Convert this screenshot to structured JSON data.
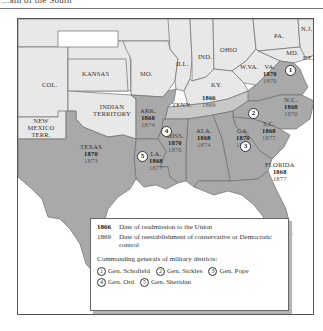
{
  "header": {
    "title": "...ath of the South"
  },
  "colors": {
    "union_states": "#e8e8e8",
    "readmitted_1866": "#c8c8c8",
    "confederate_states": "#a9a9a9",
    "borders": "#6e6e6e",
    "frame": "#555555"
  },
  "map": {
    "unlabeled_regions": [
      {
        "id": "col",
        "label": "COL."
      },
      {
        "id": "kansas",
        "label": "KANSAS"
      },
      {
        "id": "mo",
        "label": "MO."
      },
      {
        "id": "ill",
        "label": "ILL."
      },
      {
        "id": "ind",
        "label": "IND."
      },
      {
        "id": "ohio",
        "label": "OHIO"
      },
      {
        "id": "pa",
        "label": "PA."
      },
      {
        "id": "nj",
        "label": "N.J."
      },
      {
        "id": "md",
        "label": "MD."
      },
      {
        "id": "de",
        "label": "DE."
      },
      {
        "id": "wva",
        "label": "W.VA."
      },
      {
        "id": "ky",
        "label": "KY."
      },
      {
        "id": "indian_territory",
        "label": "INDIAN TERRITORY"
      },
      {
        "id": "new_mexico",
        "label": "NEW MEXICO TERR."
      }
    ],
    "states": [
      {
        "id": "va",
        "label": "VA.",
        "readmission": "1870",
        "conservative_control": "1870",
        "district": "1"
      },
      {
        "id": "nc",
        "label": "N.C.",
        "readmission": "1868",
        "conservative_control": "1870",
        "district": "2"
      },
      {
        "id": "sc",
        "label": "S.C.",
        "readmission": "1868",
        "conservative_control": "1877",
        "district": "2"
      },
      {
        "id": "tenn",
        "label": "TENN.",
        "readmission": "1866",
        "conservative_control": "1869",
        "district": ""
      },
      {
        "id": "ga",
        "label": "GA.",
        "readmission": "1870",
        "conservative_control": "1871",
        "district": "3"
      },
      {
        "id": "ala",
        "label": "ALA.",
        "readmission": "1868",
        "conservative_control": "1874",
        "district": "3"
      },
      {
        "id": "fla",
        "label": "FLORIDA",
        "readmission": "1868",
        "conservative_control": "1877",
        "district": "3"
      },
      {
        "id": "miss",
        "label": "MISS.",
        "readmission": "1870",
        "conservative_control": "1876",
        "district": "4"
      },
      {
        "id": "ark",
        "label": "ARK.",
        "readmission": "1868",
        "conservative_control": "1874",
        "district": "4"
      },
      {
        "id": "la",
        "label": "LA.",
        "readmission": "1868",
        "conservative_control": "1877",
        "district": "5"
      },
      {
        "id": "texas",
        "label": "TEXAS",
        "readmission": "1870",
        "conservative_control": "1873",
        "district": "5"
      }
    ],
    "district_badges": [
      "1",
      "2",
      "3",
      "4",
      "5"
    ]
  },
  "legend": {
    "readmission_key": "1866",
    "readmission_desc": "Date of readmission to the Union",
    "control_key": "1869",
    "control_desc": "Date of reestablishment of conservative or Democratic control",
    "generals_title": "Commanding generals of military districts:",
    "generals": [
      {
        "num": "1",
        "name": "Gen. Schofield"
      },
      {
        "num": "2",
        "name": "Gen. Sickles"
      },
      {
        "num": "3",
        "name": "Gen. Pope"
      },
      {
        "num": "4",
        "name": "Gen. Ord"
      },
      {
        "num": "5",
        "name": "Gen. Sheridan"
      }
    ]
  }
}
